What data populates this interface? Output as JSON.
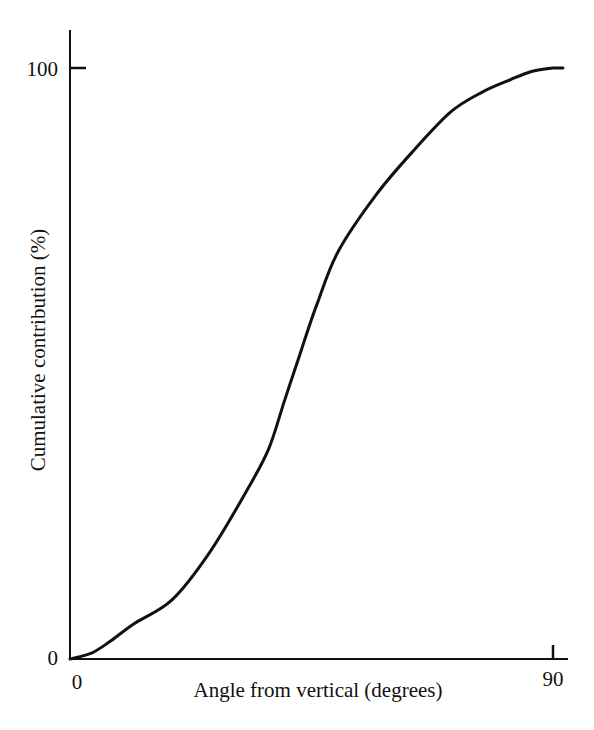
{
  "chart_data": {
    "type": "line",
    "title": "",
    "xlabel": "Angle from vertical (degrees)",
    "ylabel": "Cumulative contribution (%)",
    "xlim": [
      0,
      90
    ],
    "ylim": [
      0,
      100
    ],
    "x_ticks": [
      "0",
      "90"
    ],
    "y_ticks": [
      "0",
      "100"
    ],
    "grid": false,
    "legend": null,
    "series": [
      {
        "name": "Cumulative contribution",
        "x": [
          0,
          4,
          7.5,
          12,
          19,
          26,
          33,
          37,
          40,
          43,
          46,
          50,
          57,
          64,
          71,
          77,
          82,
          86,
          90
        ],
        "y": [
          0,
          1,
          3,
          6,
          10,
          18,
          28.6,
          35.5,
          43.8,
          52,
          60,
          69,
          78.5,
          86,
          92.6,
          96,
          98,
          99.4,
          100
        ]
      }
    ]
  },
  "labels": {
    "x_tick_0": "0",
    "x_tick_90": "90",
    "y_tick_0": "0",
    "y_tick_100": "100",
    "xlabel": "Angle from vertical (degrees)",
    "ylabel": "Cumulative contribution (%)"
  }
}
